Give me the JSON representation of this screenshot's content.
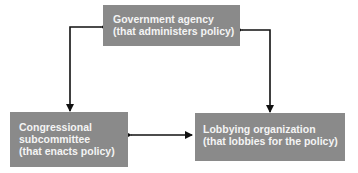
{
  "diagram": {
    "nodes": [
      {
        "id": "government-agency",
        "lines": [
          "Government agency",
          "(that administers policy)"
        ]
      },
      {
        "id": "congressional-subcommittee",
        "lines": [
          "Congressional",
          "subcommittee",
          "(that enacts policy)"
        ]
      },
      {
        "id": "lobbying-organization",
        "lines": [
          "Lobbying organization",
          "(that lobbies for the policy)"
        ]
      }
    ],
    "edges": [
      {
        "from": "government-agency",
        "to": "congressional-subcommittee",
        "direction": "both"
      },
      {
        "from": "government-agency",
        "to": "lobbying-organization",
        "direction": "both"
      },
      {
        "from": "congressional-subcommittee",
        "to": "lobbying-organization",
        "direction": "both"
      }
    ],
    "colors": {
      "box_fill": "#8a8a8a",
      "box_text": "#f4f4f4",
      "arrow": "#111111"
    }
  }
}
